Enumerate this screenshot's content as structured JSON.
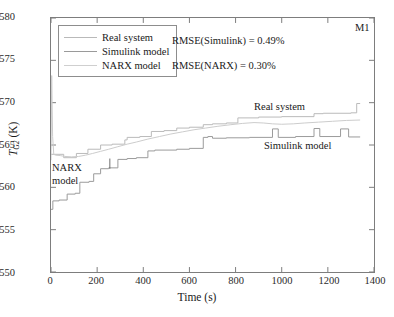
{
  "figure": {
    "panel_id": "M1",
    "background": "#ffffff",
    "frame_color": "#7d7d7d"
  },
  "annotations": {
    "rmse_simulink": "RMSE(Simulink) = 0.49%",
    "rmse_narx": "RMSE(NARX) = 0.30%",
    "inline_real": "Real system",
    "inline_simulink": "Simulink model",
    "inline_narx_line1": "NARX",
    "inline_narx_line2": "model"
  },
  "axes": {
    "ylabel_symbol": "T",
    "ylabel_sub": "G2",
    "ylabel_unit": " (K)",
    "xlabel": "Time (s)",
    "xticks": [
      "0",
      "200",
      "400",
      "600",
      "800",
      "1000",
      "1200",
      "1400"
    ],
    "yticks": [
      "550",
      "555",
      "560",
      "565",
      "570",
      "575",
      "580"
    ]
  },
  "chart_data": {
    "type": "line",
    "title": "",
    "subtitle": "",
    "panel_label": "M1",
    "xlabel": "Time (s)",
    "ylabel": "T_G2 (K)",
    "xlim": [
      0,
      1400
    ],
    "ylim": [
      550,
      580
    ],
    "xtick_values": [
      0,
      200,
      400,
      600,
      800,
      1000,
      1200,
      1400
    ],
    "ytick_values": [
      550,
      555,
      560,
      565,
      570,
      575,
      580
    ],
    "grid": false,
    "legend_position": "upper-left-inside",
    "metrics": [
      {
        "label": "RMSE(Simulink)",
        "value": 0.49,
        "unit": "%"
      },
      {
        "label": "RMSE(NARX)",
        "value": 0.3,
        "unit": "%"
      }
    ],
    "series": [
      {
        "name": "Real system",
        "color": "#b9b9b9",
        "style": "staircase",
        "points": [
          [
            0,
            563.9
          ],
          [
            55,
            563.9
          ],
          [
            55,
            563.5
          ],
          [
            110,
            563.5
          ],
          [
            110,
            564.0
          ],
          [
            160,
            564.0
          ],
          [
            160,
            564.5
          ],
          [
            215,
            564.5
          ],
          [
            215,
            565.0
          ],
          [
            265,
            565.0
          ],
          [
            265,
            565.1
          ],
          [
            320,
            565.1
          ],
          [
            320,
            565.6
          ],
          [
            330,
            565.6
          ],
          [
            330,
            565.9
          ],
          [
            385,
            565.9
          ],
          [
            385,
            566.0
          ],
          [
            435,
            566.0
          ],
          [
            435,
            566.6
          ],
          [
            490,
            566.6
          ],
          [
            490,
            566.7
          ],
          [
            545,
            566.7
          ],
          [
            545,
            567.0
          ],
          [
            600,
            567.0
          ],
          [
            600,
            567.1
          ],
          [
            660,
            567.1
          ],
          [
            660,
            567.4
          ],
          [
            700,
            567.4
          ],
          [
            700,
            567.5
          ],
          [
            760,
            567.5
          ],
          [
            760,
            567.6
          ],
          [
            810,
            567.6
          ],
          [
            810,
            568.2
          ],
          [
            900,
            568.2
          ],
          [
            900,
            568.3
          ],
          [
            1000,
            568.3
          ],
          [
            1000,
            568.35
          ],
          [
            1140,
            568.35
          ],
          [
            1140,
            568.7
          ],
          [
            1180,
            568.7
          ],
          [
            1180,
            568.75
          ],
          [
            1300,
            568.75
          ],
          [
            1300,
            568.8
          ],
          [
            1325,
            568.8
          ],
          [
            1325,
            569.9
          ],
          [
            1340,
            569.9
          ]
        ]
      },
      {
        "name": "Simulink model",
        "color": "#9a9a9a",
        "style": "staircase-with-pulses",
        "points": [
          [
            0,
            557.4
          ],
          [
            8,
            557.4
          ],
          [
            8,
            558.4
          ],
          [
            35,
            558.4
          ],
          [
            35,
            558.5
          ],
          [
            70,
            558.5
          ],
          [
            70,
            559.2
          ],
          [
            105,
            559.2
          ],
          [
            105,
            559.3
          ],
          [
            125,
            559.3
          ],
          [
            125,
            560.6
          ],
          [
            165,
            560.6
          ],
          [
            165,
            560.7
          ],
          [
            185,
            560.7
          ],
          [
            185,
            561.6
          ],
          [
            215,
            561.6
          ],
          [
            215,
            562.2
          ],
          [
            250,
            562.2
          ],
          [
            250,
            562.3
          ],
          [
            290,
            562.3
          ],
          [
            290,
            563.3
          ],
          [
            330,
            563.3
          ],
          [
            330,
            563.4
          ],
          [
            370,
            563.4
          ],
          [
            370,
            563.5
          ],
          [
            420,
            563.5
          ],
          [
            420,
            564.3
          ],
          [
            450,
            564.3
          ],
          [
            450,
            564.4
          ],
          [
            545,
            564.4
          ],
          [
            545,
            564.5
          ],
          [
            600,
            564.5
          ],
          [
            600,
            564.6
          ],
          [
            660,
            564.6
          ],
          [
            660,
            565.9
          ],
          [
            680,
            565.9
          ],
          [
            680,
            566.0
          ],
          [
            700,
            566.0
          ],
          [
            700,
            565.8
          ],
          [
            760,
            565.8
          ],
          [
            760,
            565.85
          ],
          [
            860,
            565.85
          ],
          [
            860,
            565.9
          ],
          [
            960,
            565.9
          ],
          [
            960,
            566.9
          ],
          [
            985,
            566.9
          ],
          [
            985,
            565.9
          ],
          [
            1060,
            565.9
          ],
          [
            1060,
            566.0
          ],
          [
            1140,
            566.0
          ],
          [
            1140,
            566.95
          ],
          [
            1165,
            566.95
          ],
          [
            1165,
            566.0
          ],
          [
            1255,
            566.0
          ],
          [
            1255,
            566.9
          ],
          [
            1290,
            566.9
          ],
          [
            1290,
            565.95
          ],
          [
            1340,
            565.95
          ]
        ]
      },
      {
        "name": "NARX model",
        "color": "#cccccc",
        "style": "smooth",
        "points": [
          [
            0,
            563.2
          ],
          [
            3,
            573.2
          ],
          [
            7,
            566.0
          ],
          [
            12,
            563.9
          ],
          [
            20,
            563.8
          ],
          [
            40,
            563.75
          ],
          [
            60,
            563.65
          ],
          [
            90,
            563.6
          ],
          [
            120,
            563.65
          ],
          [
            150,
            563.8
          ],
          [
            180,
            564.0
          ],
          [
            215,
            564.25
          ],
          [
            250,
            564.5
          ],
          [
            290,
            564.8
          ],
          [
            330,
            565.1
          ],
          [
            370,
            565.35
          ],
          [
            420,
            565.7
          ],
          [
            470,
            566.0
          ],
          [
            520,
            566.3
          ],
          [
            570,
            566.55
          ],
          [
            620,
            566.8
          ],
          [
            670,
            567.0
          ],
          [
            720,
            567.2
          ],
          [
            780,
            567.4
          ],
          [
            830,
            567.55
          ],
          [
            880,
            567.65
          ],
          [
            920,
            567.6
          ],
          [
            960,
            567.5
          ],
          [
            1000,
            567.45
          ],
          [
            1050,
            567.5
          ],
          [
            1100,
            567.6
          ],
          [
            1160,
            567.7
          ],
          [
            1220,
            567.8
          ],
          [
            1280,
            567.9
          ],
          [
            1340,
            567.95
          ]
        ]
      }
    ]
  },
  "legend": {
    "entries": [
      {
        "label": "Real system",
        "color": "#b9b9b9"
      },
      {
        "label": "Simulink model",
        "color": "#9a9a9a"
      },
      {
        "label": "NARX model",
        "color": "#cfcfcf"
      }
    ]
  }
}
